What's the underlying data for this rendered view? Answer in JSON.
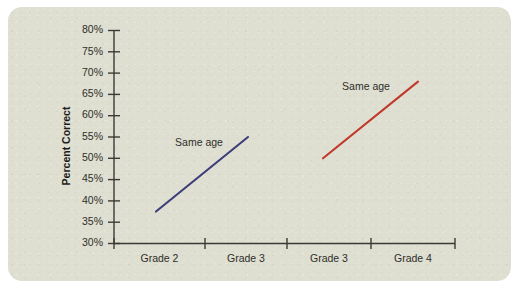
{
  "figure": {
    "background_color": "#ffffff",
    "panel_color": "#dfdfd2"
  },
  "chart_data": {
    "type": "line",
    "title": "",
    "subtitle": "",
    "xlabel": "",
    "ylabel": "Percent Correct",
    "ylim": [
      30,
      80
    ],
    "ytick_labels": [
      "30%",
      "35%",
      "40%",
      "45%",
      "50%",
      "55%",
      "60%",
      "65%",
      "70%",
      "75%",
      "80%"
    ],
    "ytick_values": [
      30,
      35,
      40,
      45,
      50,
      55,
      60,
      65,
      70,
      75,
      80
    ],
    "xtick_labels": [
      "Grade 2",
      "Grade 3",
      "Grade 3",
      "Grade 4"
    ],
    "grid": false,
    "legend": "none",
    "series": [
      {
        "name": "Same age (younger cohort)",
        "color": "#3d3d7a",
        "annotation": "Same age",
        "x": [
          "Grade 2",
          "Grade 3"
        ],
        "values": [
          37.5,
          55.0
        ]
      },
      {
        "name": "Same age (older cohort)",
        "color": "#c0392b",
        "annotation": "Same age",
        "x": [
          "Grade 3",
          "Grade 4"
        ],
        "values": [
          50.0,
          68.0
        ]
      }
    ]
  }
}
